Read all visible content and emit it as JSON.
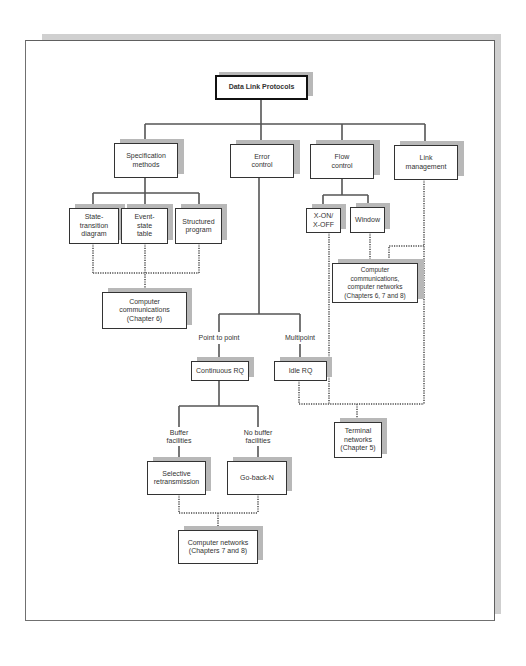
{
  "diagram": {
    "title": "Data Link Protocols",
    "nodes": {
      "root": "Data Link Protocols",
      "spec": "Specification\nmethods",
      "error": "Error\ncontrol",
      "flow": "Flow\ncontrol",
      "link": "Link\nmanagement",
      "state": "State-\ntransition\ndiagram",
      "event": "Event-\nstate\ntable",
      "structured": "Structured\nprogram",
      "xon": "X-ON/\nX-OFF",
      "window": "Window",
      "cc6": "Computer\ncommunications\n(Chapter 6)",
      "cc678": "Computer\ncommunications,\ncomputer networks\n(Chapters 6, 7 and 8)",
      "continuous": "Continuous RQ",
      "idle": "Idle RQ",
      "terminal": "Terminal\nnetworks\n(Chapter 5)",
      "selective": "Selective\nretransmission",
      "gobackn": "Go-back-N",
      "cn78": "Computer networks\n(Chapters 7 and 8)"
    },
    "labels": {
      "point_to_point": "Point to point",
      "multipoint": "Multipoint",
      "buffer": "Buffer\nfacilities",
      "no_buffer": "No buffer\nfacilities"
    },
    "edges_solid": [
      [
        "root",
        "spec"
      ],
      [
        "root",
        "error"
      ],
      [
        "root",
        "flow"
      ],
      [
        "root",
        "link"
      ],
      [
        "spec",
        "state"
      ],
      [
        "spec",
        "event"
      ],
      [
        "spec",
        "structured"
      ],
      [
        "flow",
        "xon"
      ],
      [
        "flow",
        "window"
      ],
      [
        "error",
        "continuous"
      ],
      [
        "error",
        "idle"
      ],
      [
        "continuous",
        "selective"
      ],
      [
        "continuous",
        "gobackn"
      ]
    ],
    "edges_dotted": [
      [
        "state",
        "cc6"
      ],
      [
        "event",
        "cc6"
      ],
      [
        "structured",
        "cc6"
      ],
      [
        "window",
        "cc678"
      ],
      [
        "link",
        "cc678"
      ],
      [
        "xon",
        "terminal"
      ],
      [
        "idle",
        "terminal"
      ],
      [
        "link",
        "terminal"
      ],
      [
        "selective",
        "cn78"
      ],
      [
        "gobackn",
        "cn78"
      ]
    ]
  }
}
